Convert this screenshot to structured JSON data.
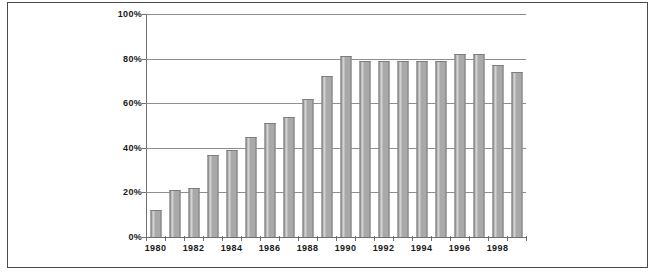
{
  "figure": {
    "border_color": "#4a4a4a",
    "background": "#ffffff"
  },
  "chart_data": {
    "type": "bar",
    "title": "",
    "subtitle": "",
    "xlabel": "",
    "ylabel": "",
    "ylim": [
      0,
      100
    ],
    "ytick_labels": [
      "100%",
      "80%",
      "60%",
      "40%",
      "20%",
      "0%"
    ],
    "ytick_values": [
      100,
      80,
      60,
      40,
      20,
      0
    ],
    "y_tick_interval": 20,
    "y_unit": "%",
    "grid": "horizontal",
    "legend": "none",
    "bar_color": "#a9a9a9",
    "bar_edge_color": "#7d7d7d",
    "categories": [
      "1980",
      "1981",
      "1982",
      "1983",
      "1984",
      "1985",
      "1986",
      "1987",
      "1988",
      "1989",
      "1990",
      "1991",
      "1992",
      "1993",
      "1994",
      "1995",
      "1996",
      "1997",
      "1998",
      "1999"
    ],
    "visible_xtick_labels": [
      "1980",
      "1982",
      "1984",
      "1986",
      "1988",
      "1990",
      "1992",
      "1994",
      "1996",
      "1998"
    ],
    "values": [
      12,
      21,
      22,
      37,
      39,
      45,
      51,
      54,
      62,
      72,
      81,
      79,
      79,
      79,
      79,
      79,
      82,
      82,
      77,
      74
    ]
  }
}
